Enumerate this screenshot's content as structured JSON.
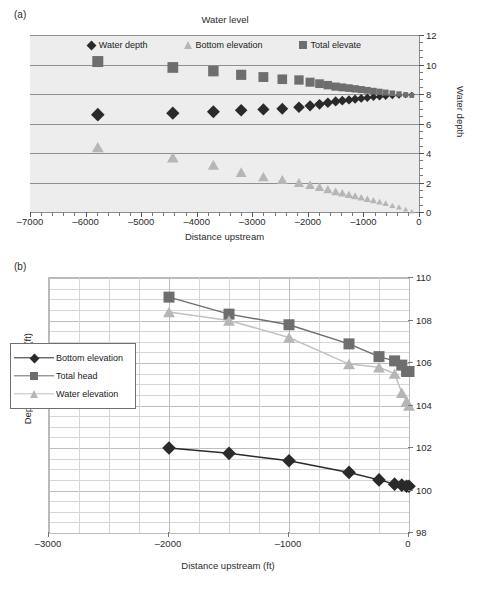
{
  "figure": {
    "panel_a_label": "(a)",
    "panel_b_label": "(b)"
  },
  "chart_data": [
    {
      "panel": "(a)",
      "type": "scatter",
      "title": "Water level",
      "xlabel": "Distance upstream",
      "ylabel": "Water depth",
      "xlim": [
        -7000,
        0
      ],
      "ylim": [
        0,
        12
      ],
      "xticks": [
        -7000,
        -6000,
        -5000,
        -4000,
        -3000,
        -2000,
        -1000,
        0
      ],
      "yticks": [
        0,
        2,
        4,
        6,
        8,
        10,
        12
      ],
      "grid": "horizontal",
      "legend_position": "top-center",
      "plot_background": "#ededed",
      "series": [
        {
          "name": "Water depth",
          "marker": "diamond",
          "color": "#2a2a2a",
          "x": [
            -5780,
            -4430,
            -3700,
            -3200,
            -2800,
            -2460,
            -2160,
            -1960,
            -1790,
            -1640,
            -1500,
            -1380,
            -1260,
            -1150,
            -1040,
            -930,
            -820,
            -710,
            -600,
            -480,
            -360,
            -240,
            -130
          ],
          "y": [
            6.6,
            6.7,
            6.8,
            6.9,
            6.95,
            7.0,
            7.1,
            7.2,
            7.3,
            7.4,
            7.5,
            7.55,
            7.6,
            7.65,
            7.7,
            7.75,
            7.8,
            7.82,
            7.85,
            7.88,
            7.9,
            7.92,
            7.95
          ]
        },
        {
          "name": "Bottom elevation",
          "marker": "triangle",
          "color": "#b6b6b6",
          "x": [
            -5780,
            -4430,
            -3700,
            -3200,
            -2800,
            -2460,
            -2160,
            -1960,
            -1790,
            -1640,
            -1500,
            -1380,
            -1260,
            -1150,
            -1040,
            -930,
            -820,
            -710,
            -600,
            -480,
            -360,
            -240,
            -130
          ],
          "y": [
            4.4,
            3.7,
            3.2,
            2.7,
            2.4,
            2.2,
            2.0,
            1.85,
            1.7,
            1.55,
            1.4,
            1.3,
            1.2,
            1.1,
            1.0,
            0.9,
            0.8,
            0.7,
            0.6,
            0.45,
            0.35,
            0.2,
            0.05
          ]
        },
        {
          "name": "Total elevate",
          "marker": "square",
          "color": "#6e6e6e",
          "x": [
            -5780,
            -4430,
            -3700,
            -3200,
            -2800,
            -2460,
            -2160,
            -1960,
            -1790,
            -1640,
            -1500,
            -1380,
            -1260,
            -1150,
            -1040,
            -930,
            -820,
            -710,
            -600,
            -480,
            -360,
            -240,
            -130
          ],
          "y": [
            10.2,
            9.8,
            9.55,
            9.3,
            9.15,
            9.0,
            8.95,
            8.8,
            8.7,
            8.6,
            8.5,
            8.45,
            8.4,
            8.35,
            8.3,
            8.25,
            8.2,
            8.15,
            8.1,
            8.05,
            8.0,
            7.95,
            7.9
          ]
        }
      ]
    },
    {
      "panel": "(b)",
      "type": "line",
      "title": "",
      "xlabel": "Distance upstream (ft)",
      "ylabel": "Depth or elevation (ft)",
      "xlim": [
        -3000,
        0
      ],
      "ylim": [
        98,
        110
      ],
      "xticks": [
        -3000,
        -2000,
        -1000,
        0
      ],
      "yticks": [
        98,
        100,
        102,
        104,
        106,
        108,
        110
      ],
      "grid": "both",
      "legend_position": "left-middle",
      "plot_background": "#ffffff",
      "series": [
        {
          "name": "Bottom elevation",
          "marker": "diamond",
          "color": "#2a2a2a",
          "x": [
            -2000,
            -1500,
            -1000,
            -500,
            -250,
            -120,
            -60,
            -20,
            0
          ],
          "y": [
            102.0,
            101.75,
            101.4,
            100.85,
            100.5,
            100.3,
            100.25,
            100.2,
            100.2
          ]
        },
        {
          "name": "Total head",
          "marker": "square",
          "color": "#6e6e6e",
          "x": [
            -2000,
            -1500,
            -1000,
            -500,
            -250,
            -120,
            -60,
            -20,
            0
          ],
          "y": [
            109.1,
            108.3,
            107.8,
            106.9,
            106.3,
            106.1,
            105.9,
            105.6,
            105.6
          ]
        },
        {
          "name": "Water elevation",
          "marker": "triangle",
          "color": "#b6b6b6",
          "x": [
            -2000,
            -1500,
            -1000,
            -500,
            -250,
            -120,
            -60,
            -20,
            0
          ],
          "y": [
            108.4,
            108.0,
            107.2,
            105.95,
            105.8,
            105.5,
            104.6,
            104.2,
            104.0
          ]
        }
      ]
    }
  ]
}
